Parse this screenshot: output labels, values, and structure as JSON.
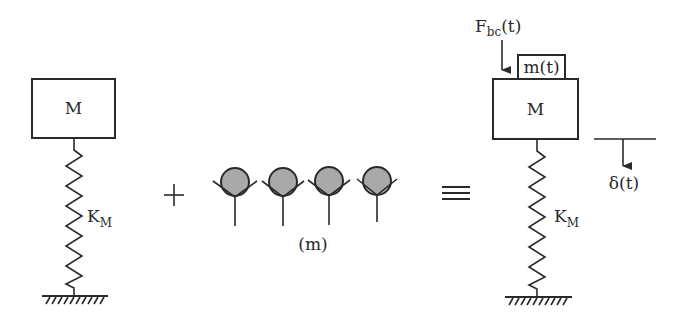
{
  "diagram": {
    "left_system": {
      "mass_label": "M",
      "spring_label_main": "K",
      "spring_label_sub": "M"
    },
    "operator_plus": "+",
    "particles": {
      "count": 4,
      "label": "(m)",
      "fill_color": "#a9a9a9"
    },
    "operator_equiv": "≡",
    "right_system": {
      "mass_label": "M",
      "added_mass_label": "m(t)",
      "force_label_main": "F",
      "force_label_sub": "bc",
      "force_label_suffix": "(t)",
      "spring_label_main": "K",
      "spring_label_sub": "M",
      "displacement_label": "δ(t)"
    },
    "colors": {
      "line": "#2a2a2a",
      "background": "#ffffff",
      "particle": "#a9a9a9"
    }
  }
}
